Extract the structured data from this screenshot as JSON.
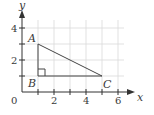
{
  "diagram": {
    "type": "coordinate-plane-triangle",
    "axes": {
      "x_label": "x",
      "y_label": "y",
      "origin_label": "0",
      "x_ticks": [
        "2",
        "4",
        "6"
      ],
      "y_ticks": [
        "2",
        "4"
      ],
      "x_range": [
        0,
        6.2
      ],
      "y_range": [
        0,
        4.4
      ],
      "grid": true
    },
    "points": [
      {
        "name": "A",
        "x": 1,
        "y": 3
      },
      {
        "name": "B",
        "x": 1,
        "y": 1
      },
      {
        "name": "C",
        "x": 5,
        "y": 1
      }
    ],
    "right_angle_at": "B",
    "colors": {
      "grid": "#d9d9d9",
      "axis": "#333333",
      "triangle": "#444444",
      "text": "#3a3a3a"
    }
  }
}
